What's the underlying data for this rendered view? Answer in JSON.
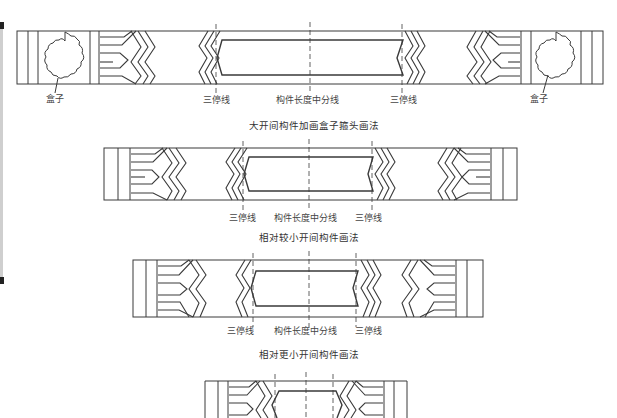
{
  "figure": {
    "type": "architectural beam painting layout (枋心/箍头 画法)",
    "stroke_color": "#3a3a3a",
    "background": "#ffffff"
  },
  "beams": [
    {
      "id": "large-span",
      "caption": "大开间构件加画盒子箍头画法",
      "has_box": true,
      "labels": {
        "box_left": "盒子",
        "box_right": "盒子",
        "third_line_left": "三停线",
        "center_line": "构件长度中分线",
        "third_line_right": "三停线"
      }
    },
    {
      "id": "smaller-span",
      "caption": "相对较小开间构件画法",
      "has_box": false,
      "labels": {
        "third_line_left": "三停线",
        "center_line": "构件长度中分线",
        "third_line_right": "三停线"
      }
    },
    {
      "id": "even-smaller-span",
      "caption": "相对更小开间构件画法",
      "has_box": false,
      "labels": {
        "third_line_left": "三停线",
        "center_line": "构件长度中分线",
        "third_line_right": "三停线"
      }
    },
    {
      "id": "smallest-span-cropped",
      "caption": "",
      "has_box": false,
      "labels": {}
    }
  ]
}
